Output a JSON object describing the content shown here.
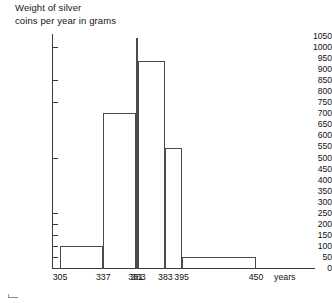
{
  "chart_data": {
    "type": "bar",
    "title": "Weight of silver\ncoins per year in grams",
    "title_lines": [
      "Weight of silver",
      "coins per year in grams"
    ],
    "xlabel": "years",
    "ylabel": "",
    "ylim": [
      0,
      1050
    ],
    "ytick_step": 50,
    "grid": false,
    "legend": null,
    "histogram": true,
    "bin_edges": [
      305,
      337,
      361,
      363,
      383,
      395,
      450
    ],
    "categories": [
      "305-337",
      "337-361",
      "361-363",
      "363-383",
      "383-395",
      "395-450"
    ],
    "values": [
      100,
      700,
      1040,
      935,
      545,
      50
    ],
    "xticks": [
      "305",
      "337",
      "361",
      "363",
      "383",
      "395",
      "450"
    ],
    "yticks": [
      "1050",
      "1000",
      "950",
      "900",
      "850",
      "800",
      "750",
      "700",
      "650",
      "600",
      "550",
      "500",
      "450",
      "400",
      "350",
      "300",
      "250",
      "200",
      "150",
      "100",
      "50",
      "0"
    ],
    "ytick_values": [
      1050,
      1000,
      950,
      900,
      850,
      800,
      750,
      700,
      650,
      600,
      550,
      500,
      450,
      400,
      350,
      300,
      250,
      200,
      150,
      100,
      50,
      0
    ],
    "ytick_marked": [
      1000,
      850,
      750,
      500,
      250,
      200,
      150,
      100,
      50
    ],
    "bars": [
      {
        "label": "305-337",
        "start": 305,
        "end": 337,
        "value": 100
      },
      {
        "label": "337-361",
        "start": 337,
        "end": 361,
        "value": 700
      },
      {
        "label": "361-363",
        "start": 361,
        "end": 363,
        "value": 1040
      },
      {
        "label": "363-383",
        "start": 363,
        "end": 383,
        "value": 935
      },
      {
        "label": "383-395",
        "start": 383,
        "end": 395,
        "value": 545
      },
      {
        "label": "395-450",
        "start": 395,
        "end": 450,
        "value": 50
      }
    ],
    "colors": {
      "axis": "#3a3a3a",
      "bar_outline": "#4a4a4a",
      "bar_fill": "#ffffff",
      "text": "#111111",
      "background": "#ffffff"
    }
  }
}
